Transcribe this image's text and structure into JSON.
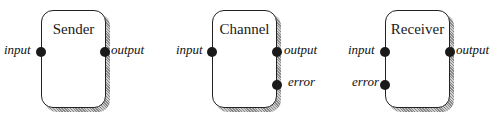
{
  "diagram": {
    "components": [
      {
        "name": "Sender",
        "ports": [
          {
            "label": "input",
            "side": "left"
          },
          {
            "label": "output",
            "side": "right"
          }
        ]
      },
      {
        "name": "Channel",
        "ports": [
          {
            "label": "input",
            "side": "left"
          },
          {
            "label": "output",
            "side": "right"
          },
          {
            "label": "error",
            "side": "right"
          }
        ]
      },
      {
        "name": "Receiver",
        "ports": [
          {
            "label": "input",
            "side": "left"
          },
          {
            "label": "error",
            "side": "left"
          },
          {
            "label": "output",
            "side": "right"
          }
        ]
      }
    ],
    "colors": {
      "border": "#222222",
      "port": "#1a1a1a",
      "shadow": "#8a8a8a",
      "background": "#ffffff"
    }
  }
}
